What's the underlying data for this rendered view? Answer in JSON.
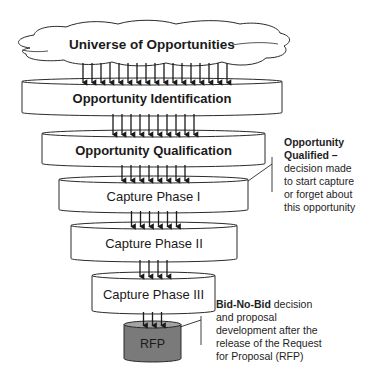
{
  "diagram": {
    "type": "funnel",
    "source": {
      "label": "Universe of Opportunities",
      "shape": "cloud"
    },
    "stages": [
      {
        "label": "Opportunity Identification",
        "bold": true,
        "arrows_in": 17,
        "x": 22,
        "w": 260,
        "y": 78,
        "h": 38
      },
      {
        "label": "Opportunity Qualification",
        "bold": true,
        "arrows_in": 10,
        "x": 42,
        "w": 223,
        "y": 130,
        "h": 37
      },
      {
        "label": "Capture Phase I",
        "bold": false,
        "arrows_in": 8,
        "x": 59,
        "w": 189,
        "y": 176,
        "h": 37
      },
      {
        "label": "Capture Phase II",
        "bold": false,
        "arrows_in": 6,
        "x": 71,
        "w": 166,
        "y": 222,
        "h": 40
      },
      {
        "label": "Capture Phase III",
        "bold": false,
        "arrows_in": 4,
        "x": 92,
        "w": 123,
        "y": 272,
        "h": 42
      },
      {
        "label": "RFP",
        "bold": false,
        "arrows_in": 3,
        "x": 124,
        "w": 57,
        "y": 321,
        "h": 41,
        "fill": "#7a7a7a",
        "top_fill": "#a3a3a3"
      }
    ],
    "annotations": [
      {
        "bold_text": "Opportunity Qualified –",
        "lines": [
          "Opportunity",
          "Qualified –",
          "decision made",
          "to start capture",
          "or forget about",
          "this opportunity"
        ],
        "bold_line_count": 2
      },
      {
        "bold_text": "Bid-No-Bid",
        "first_line_rest": " decision",
        "lines": [
          "and proposal",
          "development after the",
          "release of the Request",
          "for Proposal (RFP)"
        ]
      }
    ]
  },
  "colors": {
    "stroke": "#2a2a2a",
    "fill": "#ffffff",
    "rfp_body": "#7a7a7a",
    "rfp_top": "#a3a3a3",
    "text": "#1a1a1a"
  }
}
